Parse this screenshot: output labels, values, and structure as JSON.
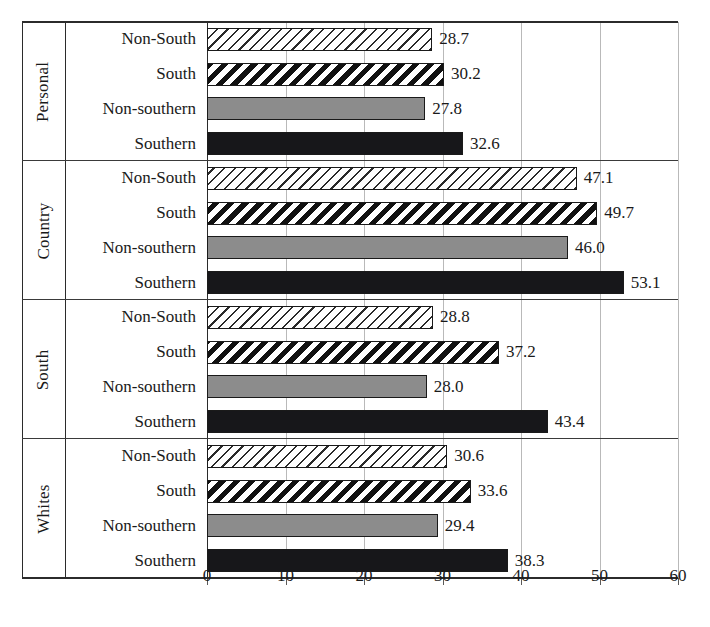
{
  "chart_data": {
    "type": "bar",
    "orientation": "horizontal",
    "title": "",
    "xlabel": "",
    "ylabel": "",
    "xlim": [
      0,
      60
    ],
    "xticks": [
      0,
      10,
      20,
      30,
      40,
      50,
      60
    ],
    "xtick_labels": [
      "0",
      "10",
      "20",
      "30",
      "40",
      "50",
      "60"
    ],
    "grid": true,
    "legend_position": "none",
    "series_order": [
      "Non-South",
      "South",
      "Non-southern",
      "Southern"
    ],
    "groups": [
      {
        "name": "Personal",
        "bars": [
          {
            "label": "Non-South",
            "value": 28.7,
            "value_label": "28.7",
            "pattern": "light-diagonal-hatch"
          },
          {
            "label": "South",
            "value": 30.2,
            "value_label": "30.2",
            "pattern": "bold-diagonal-stripe"
          },
          {
            "label": "Non-southern",
            "value": 27.8,
            "value_label": "27.8",
            "pattern": "solid-gray"
          },
          {
            "label": "Southern",
            "value": 32.6,
            "value_label": "32.6",
            "pattern": "solid-black"
          }
        ]
      },
      {
        "name": "Country",
        "bars": [
          {
            "label": "Non-South",
            "value": 47.1,
            "value_label": "47.1",
            "pattern": "light-diagonal-hatch"
          },
          {
            "label": "South",
            "value": 49.7,
            "value_label": "49.7",
            "pattern": "bold-diagonal-stripe"
          },
          {
            "label": "Non-southern",
            "value": 46.0,
            "value_label": "46.0",
            "pattern": "solid-gray"
          },
          {
            "label": "Southern",
            "value": 53.1,
            "value_label": "53.1",
            "pattern": "solid-black"
          }
        ]
      },
      {
        "name": "South",
        "bars": [
          {
            "label": "Non-South",
            "value": 28.8,
            "value_label": "28.8",
            "pattern": "light-diagonal-hatch"
          },
          {
            "label": "South",
            "value": 37.2,
            "value_label": "37.2",
            "pattern": "bold-diagonal-stripe"
          },
          {
            "label": "Non-southern",
            "value": 28.0,
            "value_label": "28.0",
            "pattern": "solid-gray"
          },
          {
            "label": "Southern",
            "value": 43.4,
            "value_label": "43.4",
            "pattern": "solid-black"
          }
        ]
      },
      {
        "name": "Whites",
        "bars": [
          {
            "label": "Non-South",
            "value": 30.6,
            "value_label": "30.6",
            "pattern": "light-diagonal-hatch"
          },
          {
            "label": "South",
            "value": 33.6,
            "value_label": "33.6",
            "pattern": "bold-diagonal-stripe"
          },
          {
            "label": "Non-southern",
            "value": 29.4,
            "value_label": "29.4",
            "pattern": "solid-gray"
          },
          {
            "label": "Southern",
            "value": 38.3,
            "value_label": "38.3",
            "pattern": "solid-black"
          }
        ]
      }
    ]
  },
  "colors": {
    "axis": "#2b2b2b",
    "gridline": "#b9b9b9",
    "solid_gray": "#8c8c8c",
    "solid_black": "#17171a",
    "text": "#1a1a1a",
    "background": "#ffffff"
  }
}
